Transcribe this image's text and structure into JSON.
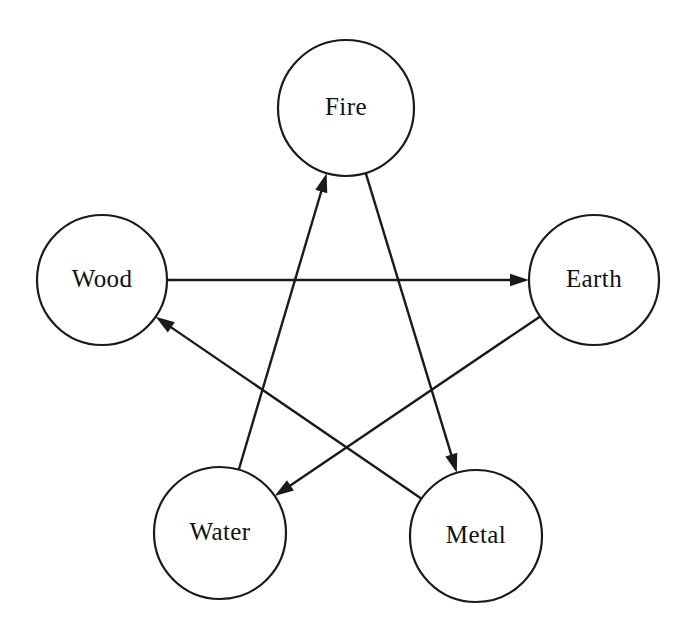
{
  "diagram": {
    "background_color": "#ffffff",
    "line_color": "#1a1a1a",
    "text_color": "#111111",
    "canvas": {
      "width": 690,
      "height": 634
    },
    "nodes": [
      {
        "id": "fire",
        "label": "Fire",
        "cx": 346,
        "cy": 108,
        "r": 68
      },
      {
        "id": "wood",
        "label": "Wood",
        "cx": 102,
        "cy": 280,
        "r": 65
      },
      {
        "id": "earth",
        "label": "Earth",
        "cx": 594,
        "cy": 280,
        "r": 65
      },
      {
        "id": "water",
        "label": "Water",
        "cx": 220,
        "cy": 533,
        "r": 66
      },
      {
        "id": "metal",
        "label": "Metal",
        "cx": 476,
        "cy": 536,
        "r": 66
      }
    ],
    "edges": [
      {
        "id": "wood-earth",
        "from": "wood",
        "to": "earth",
        "from_label": "Wood",
        "to_label": "Earth",
        "arrow": "to"
      },
      {
        "id": "earth-water",
        "from": "earth",
        "to": "water",
        "from_label": "Earth",
        "to_label": "Water",
        "arrow": "to"
      },
      {
        "id": "water-fire",
        "from": "water",
        "to": "fire",
        "from_label": "Water",
        "to_label": "Fire",
        "arrow": "to"
      },
      {
        "id": "fire-metal",
        "from": "fire",
        "to": "metal",
        "from_label": "Fire",
        "to_label": "Metal",
        "arrow": "to"
      },
      {
        "id": "metal-wood",
        "from": "metal",
        "to": "wood",
        "from_label": "Metal",
        "to_label": "Wood",
        "arrow": "to"
      }
    ]
  }
}
